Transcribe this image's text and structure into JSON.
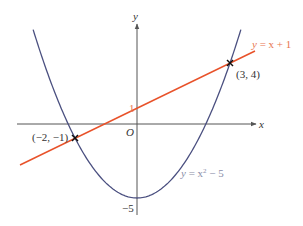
{
  "diagram": {
    "type": "coordinate-graph",
    "axes": {
      "x_label": "x",
      "y_label": "y",
      "origin_label": "O",
      "y_tick_labels": [
        "1",
        "−5"
      ]
    },
    "curves": [
      {
        "name": "parabola",
        "equation_label": "y = x² − 5",
        "color": "#4b5080"
      },
      {
        "name": "line",
        "equation_label": "y = x + 1",
        "color": "#e8522a"
      }
    ],
    "intersection_points": [
      {
        "label": "(−2, −1)",
        "x": -2,
        "y": -1
      },
      {
        "label": "(3, 4)",
        "x": 3,
        "y": 4
      }
    ],
    "labels": {
      "line_eq_y": "y",
      "line_eq_rest": " = x + 1",
      "parabola_eq_y": "y",
      "parabola_eq_mid": " = x",
      "parabola_eq_sup": "2",
      "parabola_eq_rest": " − 5",
      "point_a": "(−2, −1)",
      "point_b": "(3, 4)",
      "tick_1": "1",
      "tick_minus5": "−5"
    },
    "colors": {
      "axis": "#555555",
      "parabola": "#4b5080",
      "line": "#e8522a",
      "text": "#333333",
      "line_label": "#e8764f",
      "parabola_label": "#8a8ea8"
    }
  }
}
